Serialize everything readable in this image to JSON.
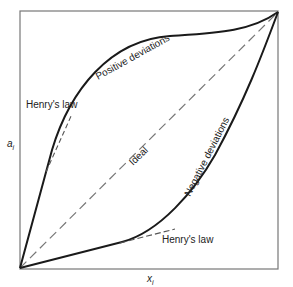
{
  "figure": {
    "type": "activity-vs-mole-fraction diagram",
    "axes": {
      "y_label": "a",
      "y_label_sub": "i",
      "x_label": "x",
      "x_label_sub": "i"
    },
    "curves": [
      {
        "name": "Positive deviations",
        "style": "solid"
      },
      {
        "name": "Ideal",
        "style": "dashed"
      },
      {
        "name": "Negative deviations",
        "style": "solid"
      }
    ],
    "labels": {
      "positive": "Positive deviations",
      "ideal": "Ideal",
      "negative": "Negative deviations",
      "henry_upper": "Henry's law",
      "henry_lower": "Henry's law"
    },
    "colors": {
      "frame": "#666666",
      "curve": "#1a1a1a",
      "dashed": "#777777",
      "text": "#222222"
    }
  }
}
